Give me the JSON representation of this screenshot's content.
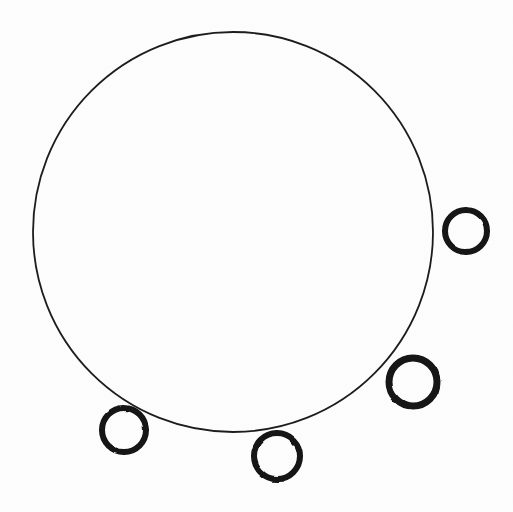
{
  "figure": {
    "kind": "geometric-line-drawing",
    "canvas": {
      "width": 513,
      "height": 512
    },
    "background_color": "#fdfdfd",
    "ink_color": "#161616"
  },
  "diagram_data": {
    "type": "scatter",
    "title": "Large circle with four tangent small circles",
    "xlabel": "",
    "ylabel": "",
    "xlim": [
      0,
      513
    ],
    "ylim": [
      0,
      512
    ],
    "grid": false,
    "legend": "none",
    "shapes": [
      {
        "name": "main-circle",
        "role": "primary-outline",
        "shape": "circle",
        "cx": 233,
        "cy": 232,
        "r": 200,
        "stroke_width": 1.8,
        "stroke": "#1d1d1d",
        "fill": "none"
      },
      {
        "name": "node-circle-right",
        "role": "perimeter-node",
        "shape": "circle",
        "index": 1,
        "cx": 466,
        "cy": 231,
        "r": 21,
        "stroke_width": 6,
        "stroke": "#121212",
        "fill": "none",
        "angle_deg": 0
      },
      {
        "name": "node-circle-lower-right",
        "role": "perimeter-node",
        "shape": "circle",
        "index": 2,
        "cx": 413,
        "cy": 382,
        "r": 24,
        "stroke_width": 7,
        "stroke": "#121212",
        "fill": "none",
        "angle_deg": 41
      },
      {
        "name": "node-circle-bottom",
        "role": "perimeter-node",
        "shape": "circle",
        "index": 3,
        "cx": 277,
        "cy": 456,
        "r": 23,
        "stroke_width": 6,
        "stroke": "#121212",
        "fill": "none",
        "angle_deg": 81
      },
      {
        "name": "node-circle-lower-left",
        "role": "perimeter-node",
        "shape": "circle",
        "index": 4,
        "cx": 124,
        "cy": 430,
        "r": 22,
        "stroke_width": 6,
        "stroke": "#121212",
        "fill": "none",
        "angle_deg": 124
      }
    ],
    "counts": {
      "large_circles": 1,
      "small_circles": 4,
      "total_circles": 5
    }
  },
  "labels": {
    "text_items": []
  }
}
